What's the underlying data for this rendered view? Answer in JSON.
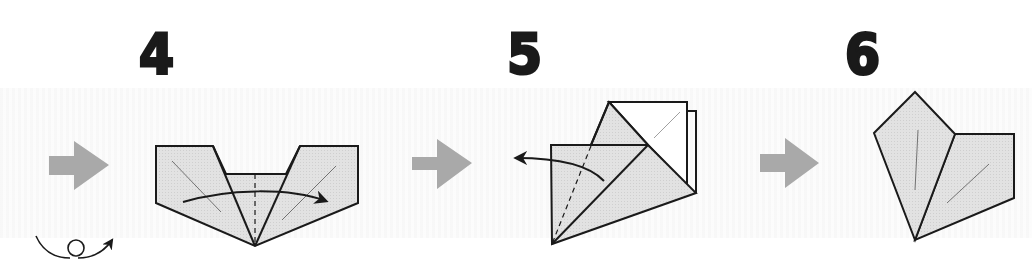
{
  "diagram": {
    "type": "origami-instructions",
    "colors": {
      "paper_fill": "#dedede",
      "paper_back": "#ffffff",
      "outline": "#1a1a1a",
      "step_arrow": "#a9a9a9",
      "number": "#1a1a1a"
    },
    "steps": [
      {
        "number": "4",
        "action": "valley-fold-right",
        "symbols": [
          "fold-arrow-right",
          "turn-over-icon"
        ]
      },
      {
        "number": "5",
        "action": "unfold-left",
        "symbols": [
          "fold-arrow-left"
        ]
      },
      {
        "number": "6",
        "action": "result",
        "symbols": []
      }
    ]
  }
}
